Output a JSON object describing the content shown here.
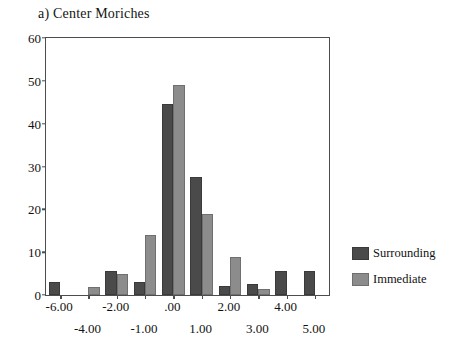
{
  "chart_data": {
    "type": "bar",
    "title": "a) Center Moriches",
    "xlabel": "",
    "ylabel": "",
    "ylim": [
      0,
      60
    ],
    "yticks": [
      0,
      10,
      20,
      30,
      40,
      50,
      60
    ],
    "ytick_labels": [
      "0",
      "10",
      "20",
      "30",
      "40",
      "50",
      "60"
    ],
    "grid": false,
    "legend_position": "right",
    "categories": [
      "-6.00",
      "-4.00",
      "-2.00",
      "-1.00",
      ".00",
      "1.00",
      "2.00",
      "3.00",
      "4.00",
      "5.00"
    ],
    "xtick_labels_upper_row": [
      "-6.00",
      "-2.00",
      ".00",
      "2.00",
      "4.00"
    ],
    "xtick_labels_lower_row": [
      "-4.00",
      "-1.00",
      "1.00",
      "3.00",
      "5.00"
    ],
    "series": [
      {
        "name": "Surrounding",
        "color": "#4a4a4a",
        "values": [
          3.0,
          0,
          5.5,
          3.0,
          44.5,
          27.5,
          2.0,
          2.5,
          5.5,
          5.5
        ]
      },
      {
        "name": "Immediate",
        "color": "#8c8c8c",
        "values": [
          0,
          1.8,
          5.0,
          14.0,
          49.0,
          19.0,
          8.8,
          1.5,
          0,
          0
        ]
      }
    ]
  },
  "legend": {
    "items": [
      {
        "label": "Surrounding",
        "color": "#4a4a4a"
      },
      {
        "label": "Immediate",
        "color": "#8c8c8c"
      }
    ]
  },
  "colors": {
    "surrounding": "#4a4a4a",
    "immediate": "#8c8c8c",
    "axis": "#4d4d4d",
    "text": "#121212",
    "background": "#ffffff"
  }
}
